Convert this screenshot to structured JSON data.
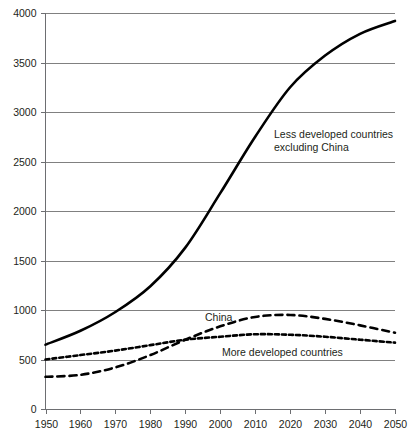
{
  "chart_data": {
    "type": "line",
    "title": "",
    "subtitle": "",
    "xlabel": "",
    "ylabel": "",
    "xlim": [
      1950,
      2050
    ],
    "ylim": [
      0,
      4000
    ],
    "grid": true,
    "legend_position": "inline-annotations",
    "x": [
      1950,
      1960,
      1970,
      1980,
      1990,
      2000,
      2010,
      2020,
      2030,
      2040,
      2050
    ],
    "xticklabels": [
      "1950",
      "1960",
      "1970",
      "1980",
      "1990",
      "2000",
      "2010",
      "2020",
      "2030",
      "2040",
      "2050"
    ],
    "yticks": [
      0,
      500,
      1000,
      1500,
      2000,
      2500,
      3000,
      3500,
      4000
    ],
    "yticklabels": [
      "0",
      "500",
      "1000",
      "1500",
      "2000",
      "2500",
      "3000",
      "3500",
      "4000"
    ],
    "series": [
      {
        "name": "Less developed countries excluding China",
        "style": "solid",
        "values": [
          650,
          790,
          980,
          1240,
          1630,
          2180,
          2750,
          3250,
          3570,
          3790,
          3920
        ]
      },
      {
        "name": "China",
        "style": "dashed",
        "values": [
          325,
          345,
          420,
          545,
          700,
          835,
          930,
          950,
          910,
          845,
          770
        ]
      },
      {
        "name": "More developed countries",
        "style": "dotted",
        "values": [
          500,
          545,
          590,
          645,
          700,
          730,
          755,
          750,
          730,
          700,
          670
        ]
      }
    ],
    "annotations": [
      {
        "id": "less-developed",
        "text_line1": "Less developed countries",
        "text_line2": "excluding China"
      },
      {
        "id": "china",
        "text": "China"
      },
      {
        "id": "more-developed",
        "text": "More developed countries"
      }
    ],
    "colors": {
      "series_line": "#000000",
      "grid": "#808080",
      "axis": "#6d6e71",
      "text": "#231f20",
      "background": "#ffffff"
    }
  }
}
